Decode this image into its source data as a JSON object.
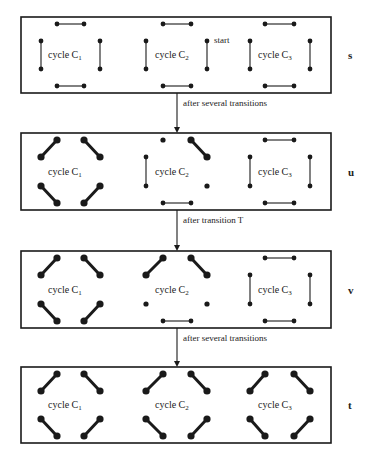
{
  "colors": {
    "stroke": "#1a1a1a",
    "background": "#ffffff"
  },
  "panels": [
    {
      "state": "s",
      "top": 17,
      "bottom": 93,
      "cycles": [
        {
          "label": "cycle C",
          "sub": "1",
          "edges": [
            "h-top",
            "v-left",
            "v-right",
            "h-bottom"
          ]
        },
        {
          "label": "cycle C",
          "sub": "2",
          "edges": [
            "h-top",
            "v-left",
            "v-right",
            "h-bottom"
          ]
        },
        {
          "label": "cycle C",
          "sub": "3",
          "edges": [
            "h-top",
            "v-left",
            "v-right",
            "h-bottom"
          ]
        }
      ],
      "annotation": "start"
    },
    {
      "state": "u",
      "top": 133,
      "bottom": 210,
      "cycles": [
        {
          "label": "cycle C",
          "sub": "1",
          "edges": [
            "d-tl",
            "d-tr",
            "d-bl",
            "d-br"
          ]
        },
        {
          "label": "cycle C",
          "sub": "2",
          "edges": [
            "dot-top-left",
            "d-tr",
            "v-left",
            "dot-right-bottom",
            "h-bottom"
          ]
        },
        {
          "label": "cycle C",
          "sub": "3",
          "edges": [
            "h-top",
            "v-left",
            "v-right",
            "h-bottom"
          ]
        }
      ]
    },
    {
      "state": "v",
      "top": 251,
      "bottom": 328,
      "cycles": [
        {
          "label": "cycle C",
          "sub": "1",
          "edges": [
            "d-tl",
            "d-tr",
            "d-bl",
            "d-br"
          ]
        },
        {
          "label": "cycle C",
          "sub": "2",
          "edges": [
            "d-tl",
            "d-tr",
            "dot-left-bottom",
            "dot-right-bottom",
            "h-bottom"
          ]
        },
        {
          "label": "cycle C",
          "sub": "3",
          "edges": [
            "h-top",
            "v-left",
            "v-right",
            "h-bottom"
          ]
        }
      ]
    },
    {
      "state": "t",
      "top": 367,
      "bottom": 443,
      "cycles": [
        {
          "label": "cycle C",
          "sub": "1",
          "edges": [
            "d-tl",
            "d-tr",
            "d-bl",
            "d-br"
          ]
        },
        {
          "label": "cycle C",
          "sub": "2",
          "edges": [
            "d-tl",
            "d-tr",
            "d-bl",
            "d-br"
          ]
        },
        {
          "label": "cycle C",
          "sub": "3",
          "edges": [
            "d-tl",
            "d-tr",
            "d-bl",
            "d-br"
          ]
        }
      ]
    }
  ],
  "arrows": [
    {
      "label": "after several transitions",
      "from": 93,
      "to": 133
    },
    {
      "label": "after transition T",
      "from": 210,
      "to": 251
    },
    {
      "label": "after several transitions",
      "from": 328,
      "to": 367
    }
  ]
}
